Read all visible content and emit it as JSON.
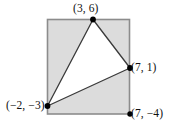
{
  "figure": {
    "colors": {
      "rectangle_fill": "#dcdcdc",
      "rectangle_stroke": "#8c8c8c",
      "triangle_fill": "#ffffff",
      "triangle_stroke": "#3a3a3a",
      "point_fill": "#000000",
      "label_color": "#101010",
      "background": "#ffffff"
    },
    "rectangle": {
      "name": "bounding-rectangle",
      "x_min": -2,
      "x_max": 7,
      "y_min": -4,
      "y_max": 6,
      "pixel": {
        "left": 47,
        "top": 19,
        "right": 130,
        "bottom": 114
      }
    },
    "triangle": {
      "name": "shaded-triangle",
      "vertices": [
        {
          "id": "p1",
          "label": "(3, 6)",
          "x": 3,
          "y": 6,
          "px": 93,
          "py": 19
        },
        {
          "id": "p2",
          "label": "(7, 1)",
          "x": 7,
          "y": 1,
          "px": 130,
          "py": 68
        },
        {
          "id": "p3",
          "label": "(−2, −3)",
          "x": -2,
          "y": -3,
          "px": 47,
          "py": 106
        }
      ]
    },
    "extra_points": [
      {
        "id": "p4",
        "label": "(7, −4)",
        "x": 7,
        "y": -4,
        "px": 130,
        "py": 114
      }
    ],
    "labels": {
      "p1": "(3, 6)",
      "p2": "(7, 1)",
      "p3": "(−2, −3)",
      "p4": "(7, −4)"
    }
  }
}
